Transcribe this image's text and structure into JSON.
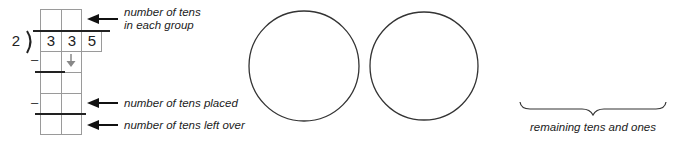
{
  "division": {
    "divisor": "2",
    "dividend_digits": [
      "3",
      "3",
      "5"
    ],
    "minus_sign": "–"
  },
  "labels": {
    "tens_each_group_line1": "number of tens",
    "tens_each_group_line2": "in each group",
    "tens_placed": "number of tens placed",
    "tens_left_over": "number of tens left over",
    "remaining": "remaining tens and ones"
  },
  "colors": {
    "line": "#222222",
    "grid": "#9a9a9a",
    "down_arrow": "#888888"
  },
  "circles": {
    "count": 2
  }
}
